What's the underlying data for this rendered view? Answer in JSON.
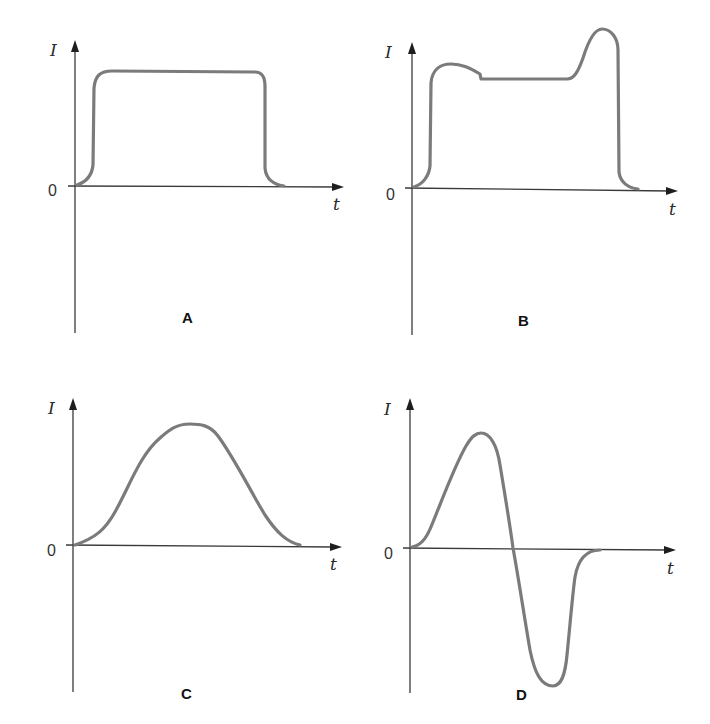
{
  "figure": {
    "curve_color": "#7b7b7b",
    "axis_color": "#3a3a3a",
    "panels": [
      {
        "id": "A",
        "label": "A",
        "y_axis_label": "I",
        "x_axis_label": "t",
        "origin_label": "0",
        "description": "Rectangular pulse: current rises quickly to a constant plateau, holds, then falls quickly to zero"
      },
      {
        "id": "B",
        "label": "B",
        "y_axis_label": "I",
        "x_axis_label": "t",
        "origin_label": "0",
        "description": "Pulse with initial overshoot bump, flat plateau, then a large spike before a rapid fall to zero"
      },
      {
        "id": "C",
        "label": "C",
        "y_axis_label": "I",
        "x_axis_label": "t",
        "origin_label": "0",
        "description": "Smooth bell-shaped pulse rising to a single rounded peak and returning to zero"
      },
      {
        "id": "D",
        "label": "D",
        "y_axis_label": "I",
        "x_axis_label": "t",
        "origin_label": "0",
        "description": "Biphasic pulse: positive lobe peak, crosses zero, deeper negative lobe, then returns to zero"
      }
    ]
  }
}
